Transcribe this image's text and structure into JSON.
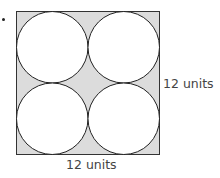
{
  "figure": {
    "type": "square-with-inscribed-circles",
    "square": {
      "fill": "#dcdcdc",
      "stroke": "#333333",
      "side_label": "12 units"
    },
    "circles": {
      "count": 4,
      "layout": "2x2",
      "fill": "#ffffff",
      "stroke": "#222222"
    },
    "labels": {
      "right": "12 units",
      "bottom": "12 units"
    }
  }
}
